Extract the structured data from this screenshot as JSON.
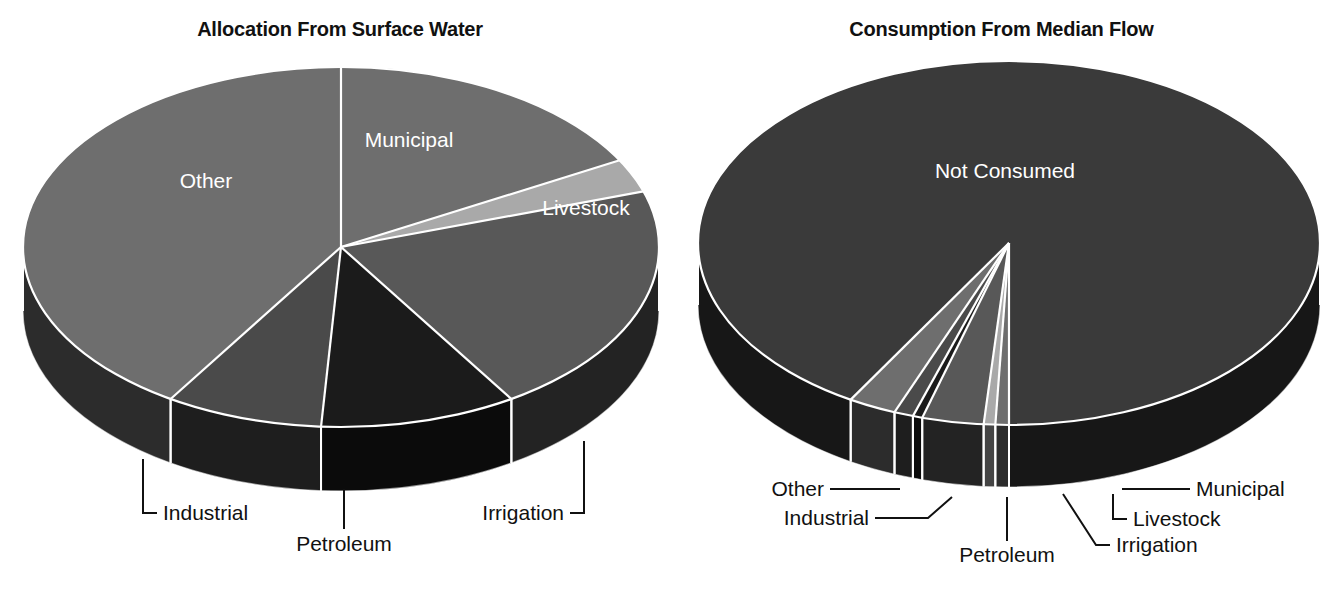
{
  "charts": [
    {
      "id": "allocation",
      "title": "Allocation From Surface Water",
      "labels_inside": [
        "Municipal",
        "Livestock",
        "Other"
      ],
      "labels_callout": [
        "Industrial",
        "Petroleum",
        "Irrigation"
      ]
    },
    {
      "id": "consumption",
      "title": "Consumption From Median Flow",
      "labels_inside": [
        "Not Consumed"
      ],
      "labels_callout": [
        "Other",
        "Industrial",
        "Petroleum",
        "Irrigation",
        "Livestock",
        "Municipal"
      ]
    }
  ],
  "left": {
    "title": "Allocation From Surface Water",
    "municipal_label": "Municipal",
    "livestock_label": "Livestock",
    "other_label": "Other",
    "industrial_label": "Industrial",
    "petroleum_label": "Petroleum",
    "irrigation_label": "Irrigation"
  },
  "right": {
    "title": "Consumption From Median Flow",
    "not_consumed_label": "Not Consumed",
    "other_label": "Other",
    "industrial_label": "Industrial",
    "petroleum_label": "Petroleum",
    "irrigation_label": "Irrigation",
    "livestock_label": "Livestock",
    "municipal_label": "Municipal"
  },
  "colors": {
    "municipal": "#6e6e6e",
    "livestock": "#a9a9a9",
    "irrigation": "#585858",
    "petroleum": "#1b1b1b",
    "industrial": "#4a4a4a",
    "other": "#6e6e6e",
    "not_consumed": "#3a3a3a",
    "separator": "#ffffff",
    "text_dark": "#111111",
    "text_light": "#ffffff",
    "background": "#ffffff"
  },
  "chart_data": [
    {
      "type": "pie",
      "title": "Allocation From Surface Water",
      "categories": [
        "Municipal",
        "Livestock",
        "Irrigation",
        "Petroleum",
        "Industrial",
        "Other"
      ],
      "values": [
        17,
        3,
        21,
        10,
        8,
        41
      ],
      "units": "percent of total",
      "labels_shown_inside": [
        "Municipal",
        "Livestock",
        "Other"
      ],
      "labels_shown_as_callout": [
        "Irrigation",
        "Petroleum",
        "Industrial"
      ],
      "legend": "none",
      "three_d": true,
      "start_angle_deg": -90,
      "direction": "clockwise"
    },
    {
      "type": "pie",
      "title": "Consumption From Median Flow",
      "categories": [
        "Not Consumed",
        "Municipal",
        "Livestock",
        "Irrigation",
        "Petroleum",
        "Industrial",
        "Other"
      ],
      "values": [
        91.5,
        0.7,
        0.6,
        3.2,
        0.5,
        1.0,
        2.5
      ],
      "units": "percent of median flow",
      "labels_shown_inside": [
        "Not Consumed"
      ],
      "labels_shown_as_callout": [
        "Other",
        "Industrial",
        "Petroleum",
        "Irrigation",
        "Livestock",
        "Municipal"
      ],
      "legend": "none",
      "three_d": true,
      "start_angle_deg": 90,
      "direction": "clockwise"
    }
  ]
}
